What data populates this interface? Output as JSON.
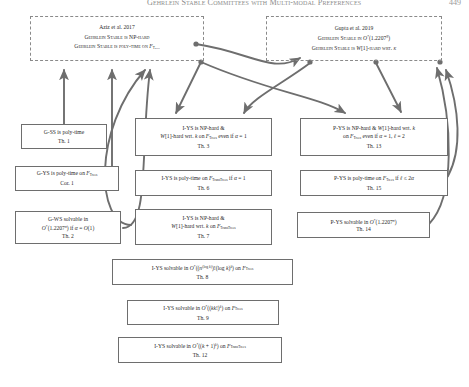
{
  "header": {
    "title": "Gehrlein Stable Committees with Multi-modal Preferences",
    "page": "449"
  },
  "colors": {
    "arrow": "#6e6e6e",
    "box_border": "#6e6e6e",
    "dashed_border": "#8a8a8a",
    "text": "#2a2a2a",
    "header_text": "#8d8d8d",
    "background": "#ffffff"
  },
  "reference_boxes": [
    {
      "id": "ref-aziz",
      "name": "aziz-reference-box",
      "lines": [
        "Aziz et al. 2017",
        "Gehrlein Stable is NP-hard",
        "Gehrlein Stable is poly-time on F_Trees"
      ]
    },
    {
      "id": "ref-gupta",
      "name": "gupta-reference-box",
      "lines": [
        "Gupta et al. 2019",
        "Gehrlein Stable in O*(1.2207^n)",
        "Gehrlein Stable is W[1]-hard wrt. k"
      ]
    }
  ],
  "nodes": [
    {
      "id": "n-th1",
      "name": "node-theorem-1",
      "lines": [
        "G-SS is poly-time"
      ],
      "ref": "Th. 1"
    },
    {
      "id": "n-cor1",
      "name": "node-corollary-1",
      "lines": [
        "G-YS is poly-time on F_Trees"
      ],
      "ref": "Cor. 1"
    },
    {
      "id": "n-th2",
      "name": "node-theorem-2",
      "lines": [
        "G-WS solvable in",
        "O*(1.2207^n) if a = O(1)"
      ],
      "ref": "Th. 2"
    },
    {
      "id": "n-th3",
      "name": "node-theorem-3",
      "lines": [
        "I-YS is NP-hard &",
        "W[1]-hard wrt. k on F_Trees even if a = 1"
      ],
      "ref": "Th. 3"
    },
    {
      "id": "n-th6",
      "name": "node-theorem-6",
      "lines": [
        "I-YS is poly-time on F_TransTrees if a = 1"
      ],
      "ref": "Th. 6"
    },
    {
      "id": "n-th7",
      "name": "node-theorem-7",
      "lines": [
        "I-YS is NP-hard &",
        "W[1]-hard wrt. k on F_TransTrees"
      ],
      "ref": "Th. 7"
    },
    {
      "id": "n-th8",
      "name": "node-theorem-8",
      "lines": [
        "I-YS solvable in O*((n^(log k))!(log k)^k) on F_Trees"
      ],
      "ref": "Th. 8"
    },
    {
      "id": "n-th9",
      "name": "node-theorem-9",
      "lines": [
        "I-YS solvable in O*((kk!)^k) on F_Trees"
      ],
      "ref": "Th. 9"
    },
    {
      "id": "n-th12",
      "name": "node-theorem-12",
      "lines": [
        "I-YS solvable in O*((k+1)^k) on F_TransTrees"
      ],
      "ref": "Th. 12"
    },
    {
      "id": "n-th13",
      "name": "node-theorem-13",
      "lines": [
        "P-YS is NP-hard & W[1]-hard wrt. k",
        "on F_Trees even if a = 1, l = 2"
      ],
      "ref": "Th. 13"
    },
    {
      "id": "n-th15",
      "name": "node-theorem-15",
      "lines": [
        "P-YS is poly-time on F_Trees if l <= 2a"
      ],
      "ref": "Th. 15"
    },
    {
      "id": "n-th14",
      "name": "node-theorem-14",
      "lines": [
        "P-YS solvable in O*(1.2207^n)"
      ],
      "ref": "Th. 14"
    }
  ],
  "arrows": [
    {
      "name": "arrow-th1-to-aziz",
      "d": "M 64,124 L 64,64",
      "dot": null
    },
    {
      "name": "arrow-cor1-to-aziz",
      "d": "M 112,166 L 112,64",
      "dot": null
    },
    {
      "name": "arrow-th2-to-gupta",
      "d": "M 121,227 C 150,229 150,120 150,68",
      "dot": [
        150,
        68
      ]
    },
    {
      "name": "arrow-aziz-to-th3",
      "d": "M 203,60 L 177,114",
      "dot": [
        203,
        60
      ]
    },
    {
      "name": "arrow-aziz-to-th13",
      "d": "M 203,60 C 300,78 330,90 350,114",
      "dot": [
        203,
        60
      ]
    },
    {
      "name": "arrow-gupta-to-th3",
      "d": "M 310,63 C 280,85 250,100 242,114",
      "dot": [
        310,
        63
      ]
    },
    {
      "name": "arrow-gupta-to-th13",
      "d": "M 375,63 L 400,114",
      "dot": [
        375,
        63
      ]
    },
    {
      "name": "arrow-th7-to-aziz",
      "d": "M 200,62 C 175,78 152,92 152,210",
      "dot": [
        200,
        62
      ]
    },
    {
      "name": "arrow-th14-to-gupta",
      "d": "M 430,224 C 455,200 452,120 440,66",
      "dot": null
    },
    {
      "name": "arrow-th13-to-up",
      "d": "M 263,63 C 300,66 318,92 330,74",
      "dot": [
        263,
        63
      ]
    }
  ]
}
